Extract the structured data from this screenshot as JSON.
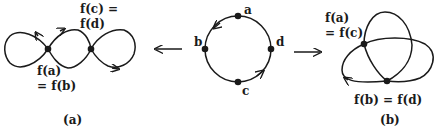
{
  "figure": {
    "center": {
      "points": [
        "a",
        "b",
        "c",
        "d"
      ]
    },
    "left": {
      "label_top_line1": "f(c) =",
      "label_top_line2": "f(d)",
      "label_bottom_line1": "f(a)",
      "label_bottom_line2": "= f(b)",
      "caption": "(a)"
    },
    "right": {
      "label_top_line1": "f(a)",
      "label_top_line2": "= f(c)",
      "label_bottom": "f(b) = f(d)",
      "caption": "(b)"
    },
    "colors": {
      "stroke": "#1a1a1a",
      "background": "#ffffff"
    }
  }
}
